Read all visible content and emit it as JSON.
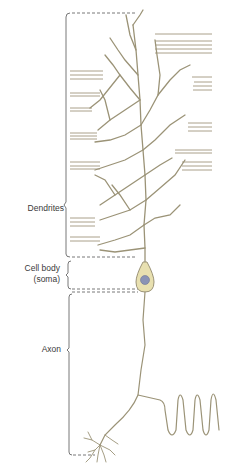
{
  "diagram": {
    "labels": {
      "dendrites": "Dendrites",
      "cell_body_line1": "Cell body",
      "cell_body_line2": "(soma)",
      "axon": "Axon"
    },
    "colors": {
      "neuron_stroke": "#9b9377",
      "neuron_fill": "#e8e0b0",
      "nucleus": "#8a93b5",
      "bracket": "#555555",
      "label_text": "#3a3a3a"
    }
  }
}
